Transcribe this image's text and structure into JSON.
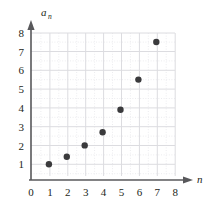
{
  "chart_data": {
    "type": "scatter",
    "title": "",
    "xlabel": "n",
    "ylabel": "a_n",
    "ylabel_base": "a",
    "ylabel_subscript": "n",
    "x": [
      1,
      2,
      3,
      4,
      5,
      6,
      7
    ],
    "values": [
      1.0,
      1.4,
      2.0,
      2.7,
      3.9,
      5.5,
      7.5
    ],
    "points": [
      {
        "n": 1,
        "a": 1.0
      },
      {
        "n": 2,
        "a": 1.4
      },
      {
        "n": 3,
        "a": 2.0
      },
      {
        "n": 4,
        "a": 2.7
      },
      {
        "n": 5,
        "a": 3.9
      },
      {
        "n": 6,
        "a": 5.5
      },
      {
        "n": 7,
        "a": 7.5
      }
    ],
    "xlim": [
      0,
      8
    ],
    "ylim": [
      0,
      8
    ],
    "xticks": [
      0,
      1,
      2,
      3,
      4,
      5,
      6,
      7,
      8
    ],
    "yticks": [
      1,
      2,
      3,
      4,
      5,
      6,
      7,
      8
    ],
    "origin_label": "0",
    "xtick_labels": [
      "0",
      "1",
      "2",
      "3",
      "4",
      "5",
      "6",
      "7",
      "8"
    ],
    "ytick_labels": [
      "1",
      "2",
      "3",
      "4",
      "5",
      "6",
      "7",
      "8"
    ],
    "grid": true,
    "minor_grid": true,
    "legend": null,
    "legend_position": "none",
    "marker": "filled-circle",
    "marker_color": "#3a3a3c",
    "grid_color": "#dddde0",
    "minor_grid_color": "#ececef",
    "axis_color": "#58585b",
    "text_color": "#231f20",
    "background": "#ffffff"
  }
}
